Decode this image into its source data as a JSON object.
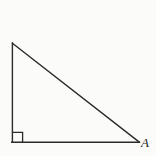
{
  "figure": {
    "kind": "right-triangle-diagram",
    "caption": "",
    "background_color": "#fbfbf9",
    "stroke_color": "#2b2b2b",
    "stroke_width": 1.4,
    "canvas": {
      "width": 156,
      "height": 156
    },
    "vertices": [
      {
        "id": "apex",
        "label": "",
        "x": 12,
        "y": 43
      },
      {
        "id": "right-angle",
        "label": "",
        "x": 12,
        "y": 142
      },
      {
        "id": "A",
        "label": "A",
        "x": 139,
        "y": 142
      }
    ],
    "edges": [
      {
        "id": "vertical-leg",
        "from": "apex",
        "to": "right-angle"
      },
      {
        "id": "horizontal-leg",
        "from": "right-angle",
        "to": "A"
      },
      {
        "id": "hypotenuse",
        "from": "apex",
        "to": "A"
      }
    ],
    "right_angle_marker": {
      "at_vertex": "right-angle",
      "x": 12,
      "y": 132,
      "size": 10
    },
    "labels": {
      "A": "A"
    }
  }
}
